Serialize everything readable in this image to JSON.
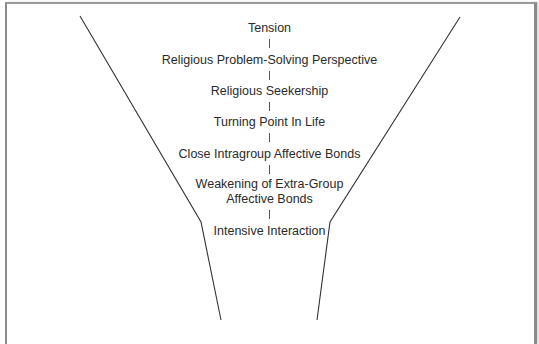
{
  "diagram": {
    "type": "funnel",
    "stages": [
      {
        "label": "Tension"
      },
      {
        "label": "Religious Problem-Solving Perspective"
      },
      {
        "label": "Religious Seekership"
      },
      {
        "label": "Turning Point In Life"
      },
      {
        "label": "Close Intragroup Affective Bonds"
      },
      {
        "label": "Weakening of Extra-Group",
        "label_line2": "Affective Bonds"
      },
      {
        "label": "Intensive Interaction"
      }
    ],
    "colors": {
      "line": "#333333",
      "text": "#2a2a2a",
      "frame": "#8a8a8a"
    }
  }
}
